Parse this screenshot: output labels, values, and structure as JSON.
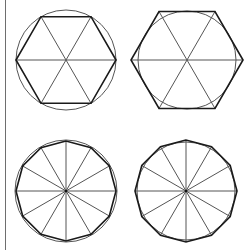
{
  "canvas": {
    "width": 251,
    "height": 250,
    "background": "#ffffff"
  },
  "colors": {
    "polygon_stroke": "#1a1a1a",
    "circle_stroke": "#555555",
    "spoke_stroke": "#555555",
    "left_rule": "#6e6e6e"
  },
  "figures": [
    {
      "id": "hexagon-inscribed-in-circle",
      "position": "top-left",
      "center": [
        66,
        60
      ],
      "circle_radius": 50,
      "polygon_sides": 6,
      "polygon_radius": 50,
      "start_angle_deg": 0,
      "spokes": 3,
      "show_circle": true
    },
    {
      "id": "hexagon-circumscribed-about-circle",
      "position": "top-right",
      "center": [
        187,
        60
      ],
      "circle_radius": 49,
      "polygon_sides": 6,
      "polygon_radius": 56,
      "start_angle_deg": 0,
      "spokes": 3,
      "show_circle": true
    },
    {
      "id": "dodecagon-inscribed-in-circle",
      "position": "bottom-left",
      "center": [
        66,
        191
      ],
      "circle_radius": 51,
      "polygon_sides": 12,
      "polygon_radius": 50,
      "start_angle_deg": 90,
      "spokes": 6,
      "show_circle": true
    },
    {
      "id": "dodecagon-circumscribed-about-circle",
      "position": "bottom-right",
      "center": [
        186,
        191
      ],
      "circle_radius": 49,
      "polygon_sides": 12,
      "polygon_radius": 51,
      "start_angle_deg": 90,
      "spokes": 6,
      "show_circle": true
    }
  ]
}
